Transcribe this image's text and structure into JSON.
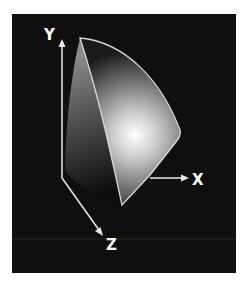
{
  "diagram": {
    "type": "3d-color-solid",
    "axes": {
      "x": {
        "label": "X"
      },
      "y": {
        "label": "Y"
      },
      "z": {
        "label": "Z"
      }
    },
    "colors": {
      "background": "#0f0f0f",
      "page": "#ffffff",
      "axis": "#e8e8e8",
      "outline": "#d8d8d8",
      "highlight": "#ffffff"
    }
  }
}
